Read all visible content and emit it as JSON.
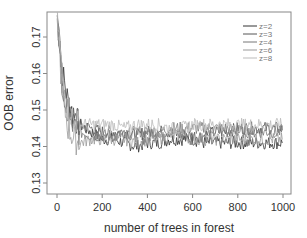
{
  "chart_data": {
    "type": "line",
    "title": "",
    "xlabel": "number of trees in forest",
    "ylabel": "OOB error",
    "xlim": [
      0,
      1000
    ],
    "ylim": [
      0.13,
      0.175
    ],
    "x_ticks": [
      0,
      200,
      400,
      600,
      800,
      1000
    ],
    "x_tick_labels": [
      "0",
      "200",
      "400",
      "600",
      "800",
      "1000"
    ],
    "y_ticks": [
      0.13,
      0.14,
      0.15,
      0.16,
      0.17
    ],
    "y_tick_labels": [
      "0.13",
      "0.14",
      "0.15",
      "0.16",
      "0.17"
    ],
    "grid": false,
    "legend_position": "top-right",
    "x": [
      1,
      25,
      50,
      75,
      100,
      150,
      200,
      250,
      300,
      350,
      400,
      450,
      500,
      550,
      600,
      650,
      700,
      750,
      800,
      850,
      900,
      950,
      1000
    ],
    "series": [
      {
        "name": "z=2",
        "color": "#333333",
        "values": [
          0.176,
          0.16,
          0.152,
          0.148,
          0.146,
          0.144,
          0.142,
          0.142,
          0.141,
          0.14,
          0.141,
          0.141,
          0.142,
          0.142,
          0.142,
          0.141,
          0.141,
          0.141,
          0.141,
          0.141,
          0.141,
          0.141,
          0.141
        ]
      },
      {
        "name": "z=3",
        "color": "#555555",
        "values": [
          0.176,
          0.156,
          0.15,
          0.147,
          0.146,
          0.145,
          0.144,
          0.144,
          0.144,
          0.143,
          0.144,
          0.144,
          0.144,
          0.143,
          0.143,
          0.143,
          0.144,
          0.144,
          0.145,
          0.145,
          0.145,
          0.145,
          0.145
        ]
      },
      {
        "name": "z=4",
        "color": "#777777",
        "values": [
          0.176,
          0.155,
          0.148,
          0.145,
          0.144,
          0.143,
          0.143,
          0.143,
          0.143,
          0.144,
          0.144,
          0.144,
          0.145,
          0.145,
          0.145,
          0.145,
          0.145,
          0.145,
          0.144,
          0.144,
          0.144,
          0.144,
          0.144
        ]
      },
      {
        "name": "z=6",
        "color": "#999999",
        "values": [
          0.176,
          0.153,
          0.145,
          0.142,
          0.141,
          0.142,
          0.142,
          0.142,
          0.142,
          0.141,
          0.142,
          0.142,
          0.143,
          0.143,
          0.142,
          0.142,
          0.142,
          0.142,
          0.142,
          0.142,
          0.142,
          0.142,
          0.142
        ]
      },
      {
        "name": "z=8",
        "color": "#bbbbbb",
        "values": [
          0.176,
          0.158,
          0.15,
          0.147,
          0.146,
          0.146,
          0.146,
          0.146,
          0.145,
          0.146,
          0.146,
          0.146,
          0.145,
          0.145,
          0.146,
          0.146,
          0.146,
          0.146,
          0.146,
          0.146,
          0.146,
          0.146,
          0.146
        ]
      }
    ]
  }
}
